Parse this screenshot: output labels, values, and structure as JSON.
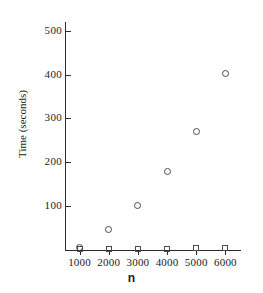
{
  "chart_data": {
    "type": "scatter",
    "title": "",
    "xlabel": "n",
    "ylabel": "Time (seconds)",
    "x": [
      1000,
      2000,
      3000,
      4000,
      5000,
      6000
    ],
    "xlim": [
      500,
      6500
    ],
    "ylim": [
      0,
      520
    ],
    "grid": false,
    "legend": null,
    "xticks": [
      "1000",
      "2000",
      "3000",
      "4000",
      "5000",
      "6000"
    ],
    "yticks": [
      "100",
      "200",
      "300",
      "400",
      "500"
    ],
    "ytick_values": [
      100,
      200,
      300,
      400,
      500
    ],
    "series": [
      {
        "name": "open-circle-series",
        "marker": "open-circle",
        "color": "#4a4a4a",
        "values": [
          5,
          47,
          101,
          178,
          270,
          403
        ]
      },
      {
        "name": "open-square-series",
        "marker": "open-square",
        "color": "#4a4a4a",
        "values": [
          2,
          2,
          3,
          3,
          4,
          4
        ]
      }
    ]
  },
  "axes": {
    "y_label_text": "Time (seconds)",
    "x_label_text": "n"
  }
}
